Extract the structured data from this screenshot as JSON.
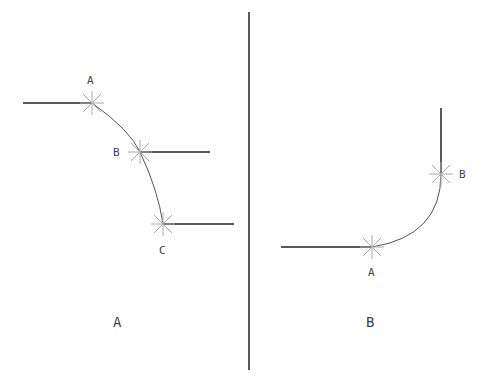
{
  "panels": [
    {
      "caption": "A",
      "points": [
        {
          "label": "A",
          "x": 92,
          "y": 103
        },
        {
          "label": "B",
          "x": 140,
          "y": 152
        },
        {
          "label": "C",
          "x": 163,
          "y": 224
        }
      ]
    },
    {
      "caption": "B",
      "points": [
        {
          "label": "A",
          "x": 372,
          "y": 247
        },
        {
          "label": "B",
          "x": 441,
          "y": 174
        }
      ]
    }
  ],
  "colors": {
    "line": "#222222",
    "marker": "#aaaaaa",
    "arc": "#555555"
  }
}
